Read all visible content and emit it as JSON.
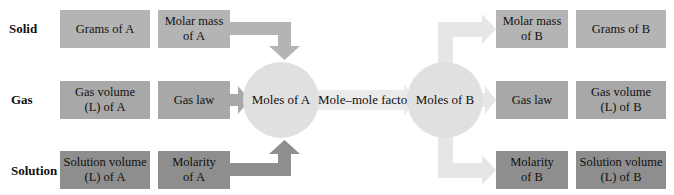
{
  "row_labels": {
    "solid": "Solid",
    "gas": "Gas",
    "solution": "Solution"
  },
  "left": {
    "solid": {
      "quantity": "Grams of A",
      "conversion": "Molar mass\nof A"
    },
    "gas": {
      "quantity": "Gas volume\n(L) of A",
      "conversion": "Gas law"
    },
    "solution": {
      "quantity": "Solution volume\n(L) of A",
      "conversion": "Molarity\nof A"
    }
  },
  "center": {
    "moles_a": "Moles of A",
    "factor": "Mole–mole factor",
    "moles_b": "Moles of B"
  },
  "right": {
    "solid": {
      "conversion": "Molar mass\nof B",
      "quantity": "Grams of B"
    },
    "gas": {
      "conversion": "Gas law",
      "quantity": "Gas volume\n(L) of B"
    },
    "solution": {
      "conversion": "Molarity\nof B",
      "quantity": "Solution volume\n(L) of B"
    }
  },
  "colors": {
    "solid_box": "#b4b4b4",
    "gas_box": "#a8a8a8",
    "solution_box": "#8e8e8e",
    "circle": "#e0e0e0",
    "arrow_left_solid": "#b4b4b4",
    "arrow_left_gas": "#a8a8a8",
    "arrow_left_solution": "#8e8e8e",
    "arrow_right": "#e4e4e4"
  }
}
